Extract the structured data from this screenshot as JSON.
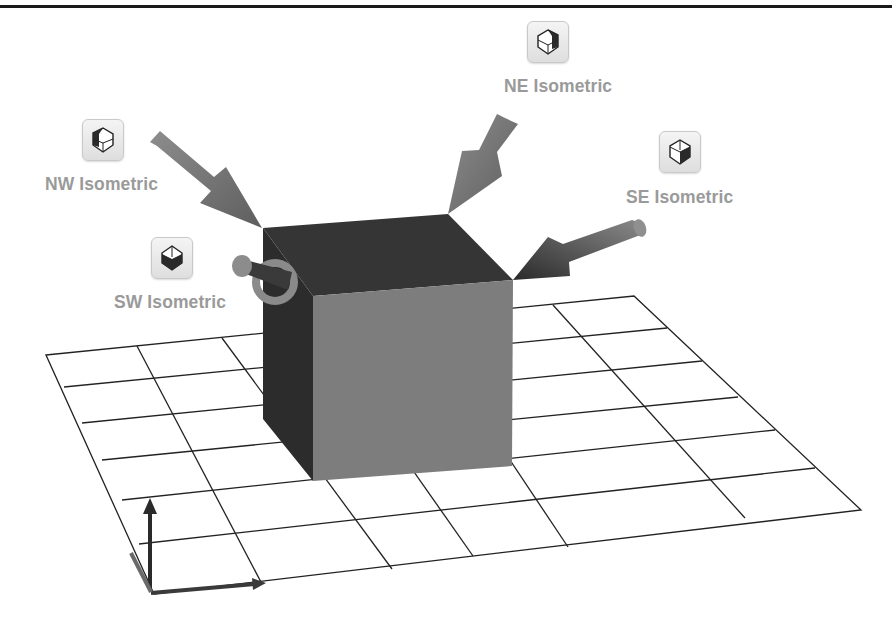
{
  "diagram": {
    "views": [
      {
        "id": "ne",
        "label": "NE Isometric",
        "icon": "ne-isometric-icon",
        "shaded_face": "top-right"
      },
      {
        "id": "nw",
        "label": "NW Isometric",
        "icon": "nw-isometric-icon",
        "shaded_face": "top-left"
      },
      {
        "id": "se",
        "label": "SE Isometric",
        "icon": "se-isometric-icon",
        "shaded_face": "bottom-right"
      },
      {
        "id": "sw",
        "label": "SW Isometric",
        "icon": "sw-isometric-icon",
        "shaded_face": "bottom-left"
      }
    ],
    "objects": {
      "cube": "cube",
      "grid": "ground-plane-grid",
      "axes": "coordinate-triad"
    },
    "colors": {
      "label": "#9a9a9a",
      "cube_top": "#333333",
      "cube_left": "#2c2c2c",
      "cube_front": "#7c7c7c",
      "arrow": "#7a7a7a",
      "grid_line": "#222222"
    }
  }
}
